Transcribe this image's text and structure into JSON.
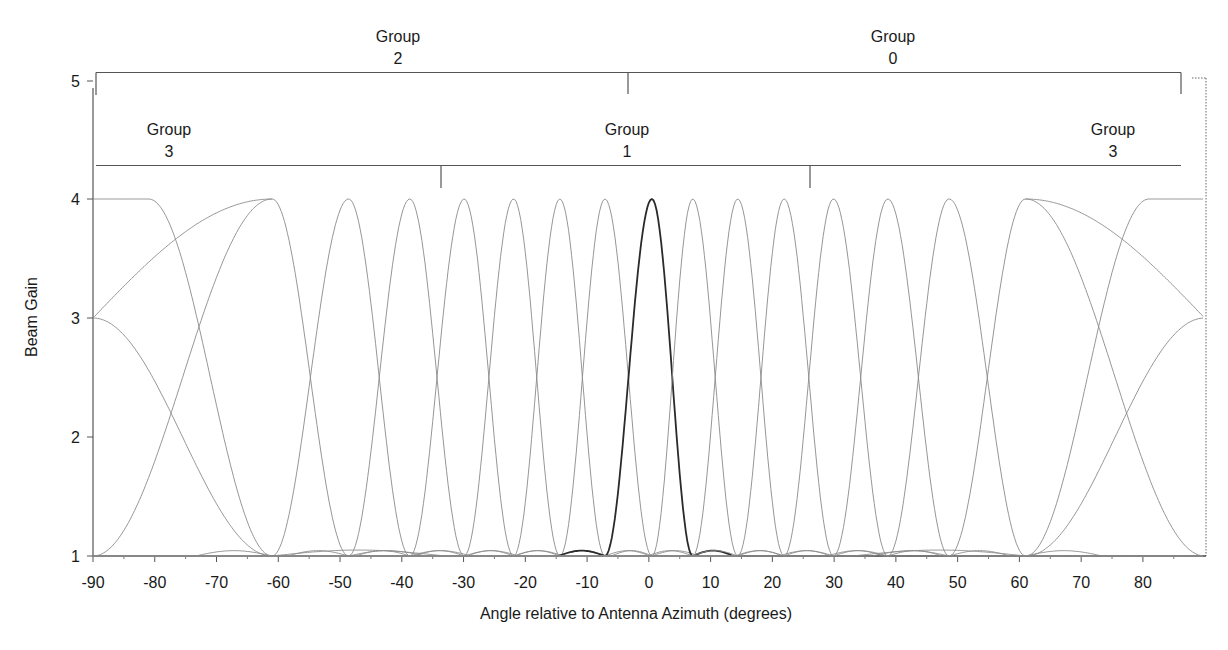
{
  "chart_data": {
    "type": "line",
    "title": "",
    "xlabel": "Angle relative to Antenna Azimuth (degrees)",
    "ylabel": "Beam Gain",
    "xlim": [
      -90,
      90
    ],
    "ylim": [
      1,
      5
    ],
    "x_ticks": [
      -90,
      -80,
      -70,
      -60,
      -50,
      -40,
      -30,
      -20,
      -10,
      0,
      10,
      20,
      30,
      40,
      50,
      60,
      70,
      80
    ],
    "x_tick_labels": [
      "-90",
      "-80",
      "-70",
      "-60",
      "-50",
      "-40",
      "-30",
      "-20",
      "-10",
      "0",
      "10",
      "20",
      "30",
      "40",
      "50",
      "60",
      "70",
      "80"
    ],
    "y_ticks": [
      1,
      2,
      3,
      4,
      5
    ],
    "y_tick_labels": [
      "1",
      "2",
      "3",
      "4",
      "5"
    ],
    "grid": false,
    "legend": null,
    "beam_peak_gain": 4,
    "beam_null_gain": 1,
    "edge_crossover_gain": 3,
    "series": [
      {
        "name": "Beam edge-left",
        "peak_angle": -90,
        "edge": true,
        "highlight": false
      },
      {
        "name": "Beam -61",
        "peak_angle": -61,
        "highlight": false
      },
      {
        "name": "Beam -48.6",
        "peak_angle": -48.6,
        "highlight": false
      },
      {
        "name": "Beam -38.7",
        "peak_angle": -38.7,
        "highlight": false
      },
      {
        "name": "Beam -29.9",
        "peak_angle": -29.9,
        "highlight": false
      },
      {
        "name": "Beam -21.9",
        "peak_angle": -21.9,
        "highlight": false
      },
      {
        "name": "Beam -14.4",
        "peak_angle": -14.4,
        "highlight": false
      },
      {
        "name": "Beam -7.1",
        "peak_angle": -7.1,
        "highlight": false
      },
      {
        "name": "Beam 0 (highlighted)",
        "peak_angle": 0.5,
        "highlight": true
      },
      {
        "name": "Beam 7.1",
        "peak_angle": 7.1,
        "highlight": false
      },
      {
        "name": "Beam 14.4",
        "peak_angle": 14.4,
        "highlight": false
      },
      {
        "name": "Beam 21.9",
        "peak_angle": 21.9,
        "highlight": false
      },
      {
        "name": "Beam 29.9",
        "peak_angle": 29.9,
        "highlight": false
      },
      {
        "name": "Beam 38.7",
        "peak_angle": 38.7,
        "highlight": false
      },
      {
        "name": "Beam 48.6",
        "peak_angle": 48.6,
        "highlight": false
      },
      {
        "name": "Beam 61",
        "peak_angle": 61,
        "highlight": false
      },
      {
        "name": "Beam edge-right",
        "peak_angle": 90,
        "edge": true,
        "highlight": false
      }
    ],
    "annotations": {
      "upper_brackets": [
        {
          "label_line1": "Group",
          "label_line2": "2",
          "from_x": -90,
          "to_x": -3.4
        },
        {
          "label_line1": "Group",
          "label_line2": "0",
          "from_x": -3.4,
          "to_x": 86.4
        }
      ],
      "lower_brackets": [
        {
          "label_line1": "Group",
          "label_line2": "3",
          "from_x": -90,
          "to_x": -33.5
        },
        {
          "label_line1": "Group",
          "label_line2": "1",
          "from_x": -33.5,
          "to_x": 26.3
        },
        {
          "label_line1": "Group",
          "label_line2": "3",
          "from_x": 26.3,
          "to_x": 86.4
        }
      ]
    }
  },
  "labels": {
    "group_2": [
      "Group",
      "2"
    ],
    "group_0": [
      "Group",
      "0"
    ],
    "group_3_left": [
      "Group",
      "3"
    ],
    "group_1": [
      "Group",
      "1"
    ],
    "group_3_right": [
      "Group",
      "3"
    ]
  },
  "colors": {
    "beam": "#8a8a8a",
    "beam_highlight": "#2a2a2a",
    "axis": "#555555",
    "text": "#1a1a1a"
  }
}
